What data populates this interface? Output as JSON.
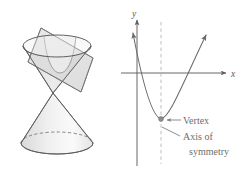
{
  "figure": {
    "background_color": "#ffffff",
    "stroke_color": "#5f5f5f",
    "text_color": "#6e6e6e"
  },
  "cone_panel": {
    "name": "double-cone-with-cutting-plane",
    "description": "Double napped cone intersected by a tilted plane producing a parabolic cross section",
    "apex_point": [
      53,
      93
    ],
    "upper_cone": {
      "fill_color": "#e9e9e9",
      "rim_center": [
        57,
        46
      ],
      "rim_rx": 34,
      "rim_ry": 11
    },
    "lower_cone": {
      "fill_color": "#ededed",
      "base_center": [
        57,
        143
      ],
      "base_rx": 36,
      "base_ry": 11,
      "hidden_edge_style": "dashed"
    },
    "cutting_plane": {
      "fill_color": "#d8d8d8",
      "opacity": 0.75,
      "tilt_label": "tilted-plane"
    },
    "parabola_cross_section": {
      "fill_color": "#f2f2f2",
      "label": "parabolic-cross-section"
    }
  },
  "graph_panel": {
    "name": "parabola-coordinate-graph",
    "axes": {
      "x_label": "x",
      "y_label": "y",
      "origin": [
        137,
        73
      ],
      "x_axis_start": [
        121,
        73
      ],
      "x_axis_end": [
        228,
        73
      ],
      "y_axis_top": [
        137,
        18
      ],
      "y_axis_bottom": [
        137,
        166
      ],
      "arrow_color": "#5f5f5f"
    },
    "curve": {
      "type": "parabola",
      "orientation": "opens-up",
      "vertex": [
        161,
        119
      ],
      "left_arrow_tip": [
        130,
        24
      ],
      "right_arrow_tip": [
        209,
        26
      ],
      "color": "#6a6a6a"
    },
    "axis_of_symmetry": {
      "style": "dashed",
      "x": 161,
      "top": [
        161,
        22
      ],
      "bottom": [
        161,
        164
      ],
      "color": "#b0b0b0"
    },
    "vertex_marker": {
      "shape": "dot",
      "position": [
        161,
        119
      ],
      "color": "#8a8a8a",
      "radius": 2.4
    },
    "callouts": [
      {
        "id": "vertex-callout",
        "lines": [
          "Vertex"
        ],
        "text_x": 183,
        "text_y": 123,
        "leader_from": [
          182,
          120
        ],
        "leader_to": [
          166,
          120
        ],
        "arrow": true
      },
      {
        "id": "axis-of-symmetry-callout",
        "lines": [
          "Axis of",
          "symmetry"
        ],
        "text_x": 183,
        "text_y": 139,
        "line2_x": 188,
        "line2_y": 154,
        "leader_from": [
          181,
          135
        ],
        "leader_to": [
          163,
          126
        ],
        "arrow": false
      }
    ]
  },
  "labels": {
    "vertex": "Vertex",
    "axis_of_line1": "Axis of",
    "axis_of_line2": "symmetry",
    "x_axis": "x",
    "y_axis": "y"
  }
}
